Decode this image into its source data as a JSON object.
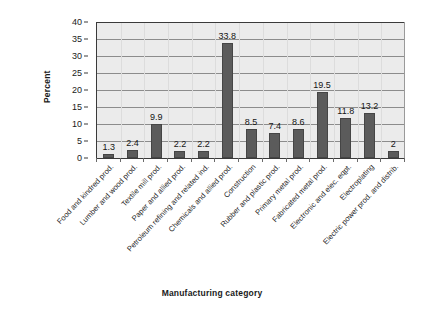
{
  "chart_data": {
    "type": "bar",
    "title": "",
    "subtitle": "",
    "xlabel": "Manufacturing category",
    "ylabel": "Percent",
    "ylim": [
      0,
      40
    ],
    "y_ticks": [
      0,
      5,
      10,
      15,
      20,
      25,
      30,
      35,
      40
    ],
    "grid": "horizontal",
    "legend": "none",
    "orientation": "vertical",
    "bar_color": "#5b5b5b",
    "plot_background": "#ebebeb",
    "value_labels_shown": true,
    "categories": [
      "Food and kindred prod.",
      "Lumber and wood prod.",
      "Textile mill prod.",
      "Paper and allied prod.",
      "Petroleum refining and related ind.",
      "Chemicals and allied prod.",
      "Construction",
      "Rubber and plastic prod.",
      "Primary metal prod.",
      "Fabricated metal prod.",
      "Electronic and elec. eqpt.",
      "Electroplating",
      "Electric power prod. and distrib."
    ],
    "values": [
      1.3,
      2.4,
      9.9,
      2.2,
      2.2,
      33.8,
      8.5,
      7.4,
      8.6,
      19.5,
      11.8,
      13.2,
      2
    ],
    "value_labels": [
      "1.3",
      "2.4",
      "9.9",
      "2.2",
      "2.2",
      "33.8",
      "8.5",
      "7.4",
      "8.6",
      "19.5",
      "11.8",
      "13.2",
      "2"
    ]
  }
}
